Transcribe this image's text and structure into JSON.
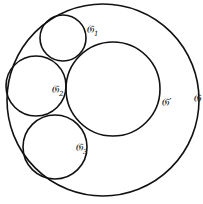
{
  "diagram": {
    "stroke_color": "#111111",
    "background": "#ffffff",
    "circles": [
      {
        "id": "G",
        "cx": 103,
        "cy": 100,
        "r": 96
      },
      {
        "id": "Gp",
        "cx": 113,
        "cy": 89,
        "r": 47
      },
      {
        "id": "G1",
        "cx": 63,
        "cy": 38,
        "r": 23
      },
      {
        "id": "G2",
        "cx": 36,
        "cy": 86,
        "r": 30
      },
      {
        "id": "G3",
        "cx": 55,
        "cy": 147,
        "r": 32
      }
    ],
    "labels": {
      "G": {
        "main": "𝔊",
        "sub": "",
        "prime": ""
      },
      "Gp": {
        "main": "𝔊",
        "sub": "",
        "prime": "′"
      },
      "G1": {
        "main": "𝔊",
        "sub": "1",
        "prime": ""
      },
      "G2": {
        "main": "𝔊",
        "sub": "2",
        "prime": ""
      },
      "G3": {
        "main": "𝔊",
        "sub": "3",
        "prime": ""
      }
    }
  }
}
